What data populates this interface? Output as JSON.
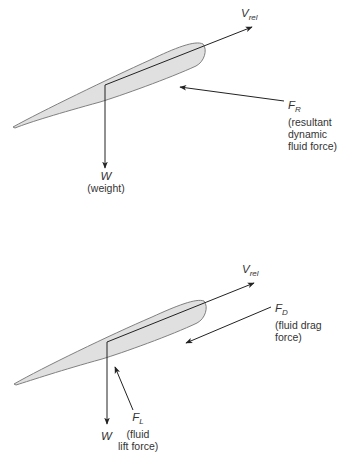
{
  "diagrams": [
    {
      "id": "resultant",
      "vrel": {
        "symbol": "V",
        "subscript": "rel"
      },
      "fr": {
        "symbol": "F",
        "subscript": "R",
        "desc": [
          "(resultant",
          "dynamic",
          "fluid force)"
        ]
      },
      "weight": {
        "symbol": "W",
        "desc": "(weight)"
      }
    },
    {
      "id": "components",
      "vrel": {
        "symbol": "V",
        "subscript": "rel"
      },
      "fd": {
        "symbol": "F",
        "subscript": "D",
        "desc": [
          "(fluid drag",
          "force)"
        ]
      },
      "fl": {
        "symbol": "F",
        "subscript": "L",
        "desc": [
          "(fluid",
          "lift force)"
        ]
      },
      "weight": {
        "symbol": "W"
      }
    }
  ],
  "colors": {
    "airfoil_fill": "#e0e0e0",
    "airfoil_stroke": "#808080",
    "arrow": "#222222"
  }
}
